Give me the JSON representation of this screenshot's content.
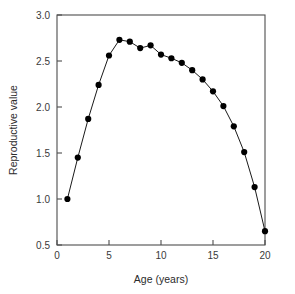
{
  "chart_data": {
    "type": "line",
    "title": "",
    "xlabel": "Age (years)",
    "ylabel": "Reproductive value",
    "xlim": [
      0,
      20
    ],
    "ylim": [
      0.5,
      3.0
    ],
    "xticks": [
      0,
      5,
      10,
      15,
      20
    ],
    "xtick_labels": [
      "0",
      "5",
      "10",
      "15",
      "20"
    ],
    "yticks": [
      0.5,
      1.0,
      1.5,
      2.0,
      2.5,
      3.0
    ],
    "ytick_labels": [
      "0.5",
      "1.0",
      "1.5",
      "2.0",
      "2.5",
      "3.0"
    ],
    "grid": false,
    "legend": false,
    "marker": "filled-circle",
    "x": [
      1,
      2,
      3,
      4,
      5,
      6,
      7,
      8,
      9,
      10,
      11,
      12,
      13,
      14,
      15,
      16,
      17,
      18,
      19,
      20
    ],
    "values": [
      1.0,
      1.45,
      1.87,
      2.24,
      2.56,
      2.73,
      2.71,
      2.64,
      2.67,
      2.57,
      2.53,
      2.48,
      2.4,
      2.3,
      2.17,
      2.01,
      1.79,
      1.51,
      1.13,
      0.65
    ],
    "series": [
      {
        "name": "Reproductive value",
        "x": [
          1,
          2,
          3,
          4,
          5,
          6,
          7,
          8,
          9,
          10,
          11,
          12,
          13,
          14,
          15,
          16,
          17,
          18,
          19,
          20
        ],
        "values": [
          1.0,
          1.45,
          1.87,
          2.24,
          2.56,
          2.73,
          2.71,
          2.64,
          2.67,
          2.57,
          2.53,
          2.48,
          2.4,
          2.3,
          2.17,
          2.01,
          1.79,
          1.51,
          1.13,
          0.65
        ]
      }
    ],
    "colors": {
      "line": "#1a1a1a",
      "marker": "#000000",
      "axis": "#4d4d4d",
      "text": "#2b2b2b",
      "background": "#ffffff"
    }
  }
}
